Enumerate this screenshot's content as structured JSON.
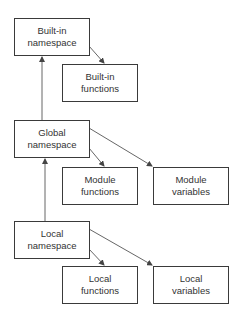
{
  "diagram": {
    "type": "namespace-hierarchy",
    "nodes": [
      {
        "id": "builtin_ns",
        "line1": "Built-in",
        "line2": "namespace",
        "x": 14,
        "y": 18,
        "w": 76,
        "h": 38
      },
      {
        "id": "builtin_fn",
        "line1": "Built-in",
        "line2": "functions",
        "x": 62,
        "y": 64,
        "w": 76,
        "h": 38
      },
      {
        "id": "global_ns",
        "line1": "Global",
        "line2": "namespace",
        "x": 14,
        "y": 120,
        "w": 76,
        "h": 38
      },
      {
        "id": "module_fn",
        "line1": "Module",
        "line2": "functions",
        "x": 62,
        "y": 167,
        "w": 76,
        "h": 38
      },
      {
        "id": "module_var",
        "line1": "Module",
        "line2": "variables",
        "x": 153,
        "y": 167,
        "w": 76,
        "h": 38
      },
      {
        "id": "local_ns",
        "line1": "Local",
        "line2": "namespace",
        "x": 14,
        "y": 221,
        "w": 76,
        "h": 38
      },
      {
        "id": "local_fn",
        "line1": "Local",
        "line2": "functions",
        "x": 62,
        "y": 266,
        "w": 76,
        "h": 38
      },
      {
        "id": "local_var",
        "line1": "Local",
        "line2": "variables",
        "x": 153,
        "y": 266,
        "w": 76,
        "h": 38
      }
    ],
    "edges": [
      {
        "from": "global_ns",
        "to": "builtin_ns",
        "kind": "parent"
      },
      {
        "from": "local_ns",
        "to": "global_ns",
        "kind": "parent"
      },
      {
        "from": "builtin_ns",
        "to": "builtin_fn",
        "kind": "contains"
      },
      {
        "from": "global_ns",
        "to": "module_fn",
        "kind": "contains"
      },
      {
        "from": "global_ns",
        "to": "module_var",
        "kind": "contains"
      },
      {
        "from": "local_ns",
        "to": "local_fn",
        "kind": "contains"
      },
      {
        "from": "local_ns",
        "to": "local_var",
        "kind": "contains"
      }
    ],
    "colors": {
      "line": "#555555",
      "border": "#3a3a3a",
      "text": "#333333",
      "background": "#ffffff"
    }
  }
}
